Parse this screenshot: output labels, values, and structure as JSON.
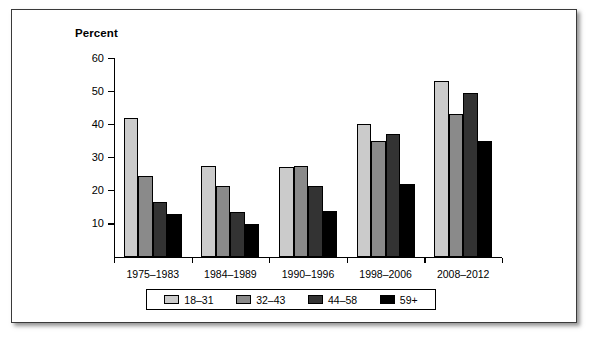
{
  "chart_data": {
    "type": "bar",
    "title": "",
    "ylabel": "Percent",
    "xlabel": "",
    "ylim": [
      0,
      60
    ],
    "yticks": [
      10,
      20,
      30,
      40,
      50,
      60
    ],
    "grid": false,
    "legend_position": "bottom",
    "categories": [
      "1975–1983",
      "1984–1989",
      "1990–1996",
      "1998–2006",
      "2008–2012"
    ],
    "series": [
      {
        "name": "18–31",
        "color": "#cbcbcb",
        "values": [
          42,
          27.5,
          27,
          40,
          53
        ]
      },
      {
        "name": "32–43",
        "color": "#8a8a8a",
        "values": [
          24.5,
          21.5,
          27.3,
          35,
          43
        ]
      },
      {
        "name": "44–58",
        "color": "#333333",
        "values": [
          16.5,
          13.5,
          21.3,
          37,
          49.5
        ]
      },
      {
        "name": "59+",
        "color": "#000000",
        "values": [
          13,
          10,
          14,
          22,
          35
        ]
      }
    ]
  },
  "axis": {
    "y_title": "Percent"
  }
}
